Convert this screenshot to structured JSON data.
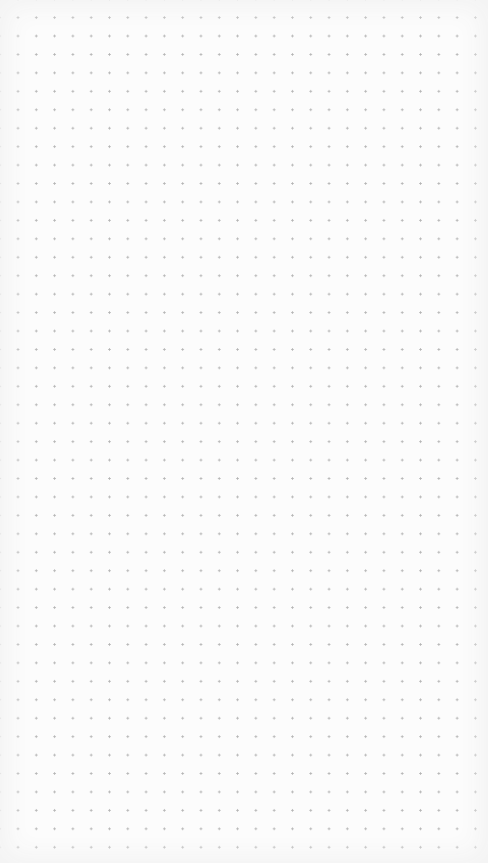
{
  "canvas": {
    "type": "dot-grid",
    "background_color": "#fcfcfc",
    "dot_color": "#b4b4b4",
    "columns": 25,
    "rows": 44
  }
}
